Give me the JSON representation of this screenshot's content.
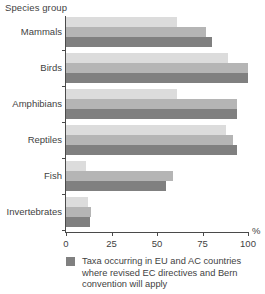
{
  "chart_data": {
    "type": "bar",
    "orientation": "horizontal",
    "title": "",
    "ylabel": "Species group",
    "xlabel": "%",
    "xlim": [
      0,
      100
    ],
    "xticks": [
      0,
      25,
      50,
      75,
      100
    ],
    "xtick_labels": [
      "0",
      "25",
      "50",
      "75",
      "100"
    ],
    "grid": false,
    "legend_position": "bottom",
    "categories": [
      "Mammals",
      "Birds",
      "Amphibians",
      "Reptiles",
      "Fish",
      "Invertebrates"
    ],
    "series": [
      {
        "name": "series-1",
        "color": "#dcdcdc",
        "values": [
          61,
          89,
          61,
          88,
          11,
          12
        ]
      },
      {
        "name": "series-2",
        "color": "#b5b5b5",
        "values": [
          77,
          100,
          94,
          92,
          59,
          14
        ]
      },
      {
        "name": "Taxa occurring in EU and  AC countries where revised EC directives and Bern convention will apply",
        "color": "#808080",
        "values": [
          80,
          100,
          94,
          94,
          55,
          13
        ]
      }
    ],
    "legend": [
      {
        "color": "#808080",
        "label": "Taxa occurring in EU and  AC countries where revised EC directives and Bern convention will apply"
      }
    ]
  },
  "colors": {
    "series_light": "#dcdcdc",
    "series_medium": "#b5b5b5",
    "series_dark": "#808080",
    "axis": "#4a4a4a",
    "text": "#3f3f3f",
    "background": "#ffffff"
  }
}
